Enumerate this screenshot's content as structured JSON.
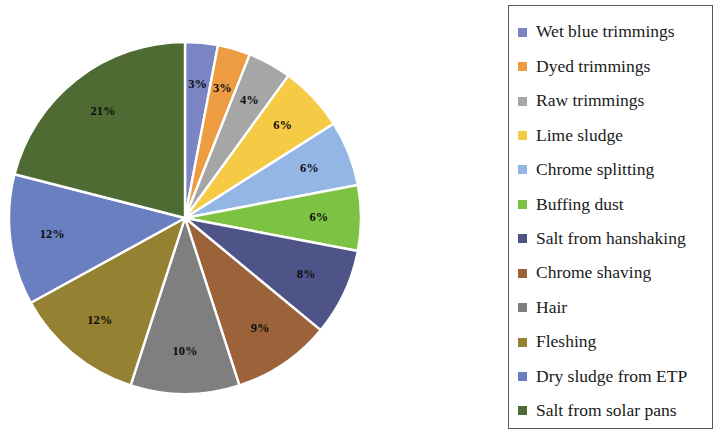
{
  "chart_data": {
    "type": "pie",
    "title": "",
    "labels": [
      "Wet blue trimmings",
      "Dyed trimmings",
      "Raw trimmings",
      "Lime sludge",
      "Chrome splitting",
      "Buffing dust",
      "Salt from hanshaking",
      "Chrome shaving",
      "Hair",
      "Fleshing",
      "Dry sludge from ETP",
      "Salt from solar pans"
    ],
    "values": [
      3,
      3,
      4,
      6,
      6,
      6,
      8,
      9,
      10,
      12,
      12,
      21
    ],
    "data_labels": [
      "3%",
      "3%",
      "4%",
      "6%",
      "6%",
      "6%",
      "8%",
      "9%",
      "10%",
      "12%",
      "12%",
      "21%"
    ],
    "colors": [
      "#7b85c4",
      "#ed9c42",
      "#a6a6a6",
      "#f5cb45",
      "#93b6e4",
      "#7dc242",
      "#4f5488",
      "#9c6239",
      "#7f7f7f",
      "#958132",
      "#6a7fbf",
      "#4e6b33"
    ],
    "start_angle_deg": 0,
    "direction": "clockwise",
    "legend_position": "right",
    "grid": false,
    "xlabel": "",
    "ylabel": ""
  },
  "legend": {
    "items": [
      {
        "label": "Wet blue trimmings",
        "color": "#7b85c4"
      },
      {
        "label": "Dyed trimmings",
        "color": "#ed9c42"
      },
      {
        "label": "Raw trimmings",
        "color": "#a6a6a6"
      },
      {
        "label": "Lime sludge",
        "color": "#f5cb45"
      },
      {
        "label": "Chrome splitting",
        "color": "#93b6e4"
      },
      {
        "label": "Buffing dust",
        "color": "#7dc242"
      },
      {
        "label": "Salt from hanshaking",
        "color": "#4f5488"
      },
      {
        "label": "Chrome shaving",
        "color": "#9c6239"
      },
      {
        "label": "Hair",
        "color": "#7f7f7f"
      },
      {
        "label": "Fleshing",
        "color": "#958132"
      },
      {
        "label": "Dry sludge from ETP",
        "color": "#6a7fbf"
      },
      {
        "label": "Salt from solar pans",
        "color": "#4e6b33"
      }
    ]
  }
}
